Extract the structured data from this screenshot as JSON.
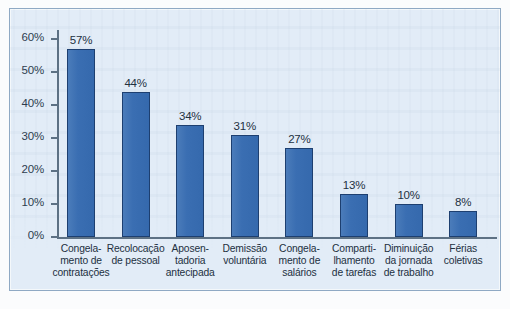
{
  "chart_data": {
    "type": "bar",
    "title": "",
    "subtitle": "",
    "xlabel": "",
    "ylabel": "",
    "ylim": [
      0,
      60
    ],
    "grid": false,
    "legend": false,
    "legend_position": "none",
    "orientation": "vertical",
    "value_suffix": "%",
    "y_ticks": [
      "0%",
      "10%",
      "20%",
      "30%",
      "40%",
      "50%",
      "60%"
    ],
    "y_tick_values": [
      0,
      10,
      20,
      30,
      40,
      50,
      60
    ],
    "categories": [
      "Congela-\nmento de\ncontratações",
      "Recolocação\nde pessoal",
      "Aposen-\ntadoria\nantecipada",
      "Demissão\nvoluntária",
      "Congela-\nmento de\nsalários",
      "Comparti-\nlhamento\nde tarefas",
      "Diminuição\nda jornada\nde trabalho",
      "Férias\ncoletivas"
    ],
    "values": [
      57,
      44,
      34,
      31,
      27,
      13,
      10,
      8
    ],
    "value_labels": [
      "57%",
      "44%",
      "34%",
      "31%",
      "27%",
      "13%",
      "10%",
      "8%"
    ],
    "colors": {
      "bar_fill": "#3a6eb2",
      "bar_stroke": "#1d3f70",
      "axis": "#5d7184",
      "text": "#22303f",
      "plot_background": "#e2ecf7",
      "frame_border": "#8fa9c4",
      "page_background": "#fbfcfd"
    }
  }
}
